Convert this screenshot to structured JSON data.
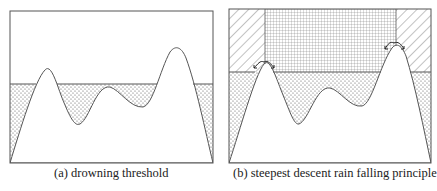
{
  "panels": [
    {
      "id": "a",
      "caption": "(a)  drowning threshold",
      "regions": [
        "dotted water below threshold"
      ]
    },
    {
      "id": "b",
      "caption": "(b)  steepest descent rain falling principle",
      "regions": [
        "dotted water below threshold",
        "diagonal-hatched side regions above threshold",
        "cross-hatched region between peaks",
        "arrows at peaks showing steepest descent"
      ]
    }
  ],
  "colors": {
    "line": "#555555",
    "fill_pattern": "#666666",
    "background": "#ffffff"
  }
}
